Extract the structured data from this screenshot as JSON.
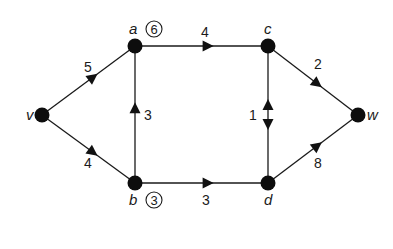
{
  "diagram": {
    "type": "directed-weighted-graph",
    "nodes": [
      {
        "id": "v",
        "label": "v",
        "x": 42,
        "y": 115,
        "label_dx": -16,
        "label_dy": 5
      },
      {
        "id": "a",
        "label": "a",
        "x": 135,
        "y": 46,
        "label_dx": -6,
        "label_dy": -12,
        "badge": "6"
      },
      {
        "id": "b",
        "label": "b",
        "x": 135,
        "y": 183,
        "label_dx": -6,
        "label_dy": 22,
        "badge": "3"
      },
      {
        "id": "c",
        "label": "c",
        "x": 268,
        "y": 46,
        "label_dx": -4,
        "label_dy": -12
      },
      {
        "id": "d",
        "label": "d",
        "x": 268,
        "y": 183,
        "label_dx": -4,
        "label_dy": 22
      },
      {
        "id": "w",
        "label": "w",
        "x": 358,
        "y": 115,
        "label_dx": 9,
        "label_dy": 5
      }
    ],
    "edges": [
      {
        "from": "v",
        "to": "a",
        "weight": "5",
        "label_x": 88,
        "label_y": 72
      },
      {
        "from": "v",
        "to": "b",
        "weight": "4",
        "label_x": 88,
        "label_y": 168
      },
      {
        "from": "b",
        "to": "a",
        "weight": "3",
        "label_x": 148,
        "label_y": 120
      },
      {
        "from": "a",
        "to": "c",
        "weight": "4",
        "label_x": 205,
        "label_y": 37
      },
      {
        "from": "b",
        "to": "d",
        "weight": "3",
        "label_x": 206,
        "label_y": 205
      },
      {
        "from": "c",
        "to": "d",
        "weight": "1",
        "bidirectional": true,
        "label_x": 253,
        "label_y": 120
      },
      {
        "from": "c",
        "to": "w",
        "weight": "2",
        "label_x": 318,
        "label_y": 69
      },
      {
        "from": "d",
        "to": "w",
        "weight": "8",
        "label_x": 318,
        "label_y": 168
      }
    ],
    "colors": {
      "ink": "#111111",
      "background": "#ffffff"
    }
  }
}
